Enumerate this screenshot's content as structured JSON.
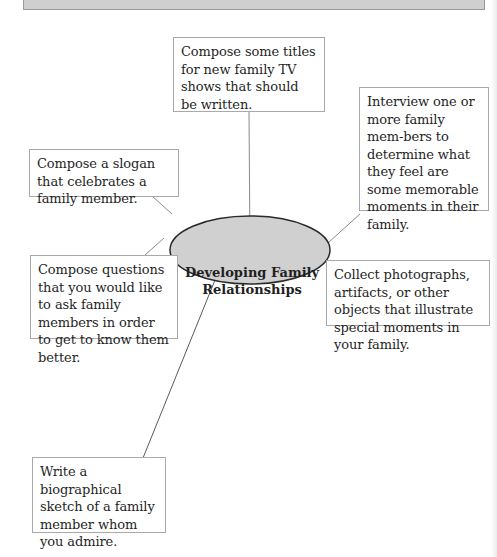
{
  "diagram": {
    "center": {
      "line1": "Developing Family",
      "line2": "Relationships"
    },
    "nodes": [
      {
        "id": "tv-titles",
        "text": "Compose some titles for new family TV shows that should be written."
      },
      {
        "id": "interview",
        "text": "Interview one or more family mem-bers to determine what they feel are some memorable moments in their family."
      },
      {
        "id": "slogan",
        "text": "Compose a slogan that celebrates a family member."
      },
      {
        "id": "questions",
        "text": "Compose questions that you would like to ask family members in order to get to know them better."
      },
      {
        "id": "collect",
        "text": "Collect photographs, artifacts, or other objects that illustrate special moments in your family."
      },
      {
        "id": "biography",
        "text": "Write a biographical sketch of a family member whom you admire."
      }
    ],
    "colors": {
      "ellipse_fill": "#d0d0d0",
      "ellipse_stroke": "#2a2a2a",
      "box_border": "#a9a9a9",
      "top_bar": "#cfcfcf"
    }
  }
}
